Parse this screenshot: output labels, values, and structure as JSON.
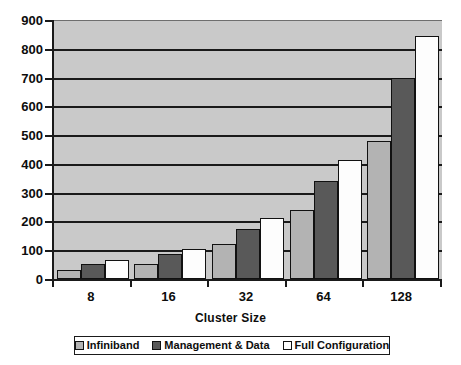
{
  "chart_data": {
    "type": "bar",
    "title": "",
    "subtitle": "",
    "xlabel": "Cluster Size",
    "ylabel": "",
    "categories": [
      "8",
      "16",
      "32",
      "64",
      "128"
    ],
    "series": [
      {
        "name": "Infiniband",
        "color": "#b3b3b3",
        "values": [
          30,
          52,
          122,
          240,
          480
        ]
      },
      {
        "name": "Management & Data",
        "color": "#595959",
        "values": [
          52,
          88,
          173,
          340,
          700
        ]
      },
      {
        "name": "Full Configuration",
        "color": "#fdfdfd",
        "values": [
          67,
          105,
          213,
          415,
          845
        ]
      }
    ],
    "ylim": [
      0,
      900
    ],
    "ytick_step": 100,
    "yticks": [
      "900",
      "800",
      "700",
      "600",
      "500",
      "400",
      "300",
      "200",
      "100",
      "0"
    ],
    "grid": true,
    "grid_axis": "y",
    "legend_position": "bottom",
    "plot_background": "#c9c9c9",
    "axis_color": "#1a1a1a",
    "gridline_color": "#1a1a1a"
  }
}
